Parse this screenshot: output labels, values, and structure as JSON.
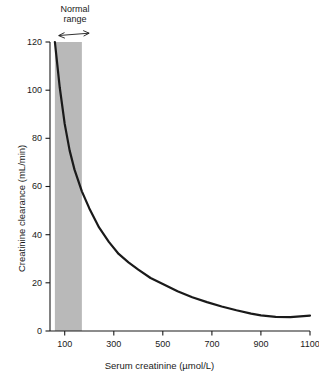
{
  "chart_data": {
    "type": "line",
    "title": "",
    "xlabel": "Serum creatinine (µmol/L)",
    "ylabel": "Creatinine clearance (mL/min)",
    "xlim": [
      40,
      1100
    ],
    "ylim": [
      0,
      120
    ],
    "grid": false,
    "legend": null,
    "xticks": [
      100,
      300,
      500,
      700,
      900,
      1100
    ],
    "xtick_labels": [
      "100",
      "300",
      "500",
      "700",
      "900",
      "1100"
    ],
    "yticks": [
      0,
      20,
      40,
      60,
      80,
      100,
      120
    ],
    "ytick_labels": [
      "0",
      "20",
      "40",
      "60",
      "80",
      "100",
      "120"
    ],
    "series": [
      {
        "name": "Creatinine clearance",
        "color": "#1a1a1a",
        "x": [
          60,
          80,
          100,
          120,
          140,
          170,
          200,
          240,
          280,
          320,
          360,
          400,
          450,
          500,
          560,
          620,
          680,
          740,
          800,
          860,
          900,
          960,
          1020,
          1100
        ],
        "y": [
          120,
          101,
          86,
          75,
          67,
          58,
          51,
          43,
          37,
          32,
          28.5,
          25.5,
          22,
          19.5,
          16.5,
          14,
          12,
          10.2,
          8.6,
          7.2,
          6.5,
          5.9,
          5.8,
          6.4
        ]
      }
    ],
    "shaded_regions": [
      {
        "name": "normal-range-band",
        "label": "Normal range",
        "x_start": 60,
        "x_end": 170,
        "y_start": 0,
        "y_end": 120,
        "color": "#b9b9b9"
      }
    ],
    "annotations": [
      {
        "name": "normal-range-annotation",
        "text_line1": "Normal",
        "text_line2": "range",
        "arrow": "double-headed-horizontal",
        "arrow_x_start": 60,
        "arrow_x_end": 170
      }
    ]
  },
  "axes": {
    "x_title": "Serum creatinine (µmol/L)",
    "y_title": "Creatinine clearance (mL/min)",
    "axis_color": "#1a1a1a"
  },
  "annotation": {
    "normal_line1": "Normal",
    "normal_line2": "range"
  },
  "ticks": {
    "x": [
      "100",
      "300",
      "500",
      "700",
      "900",
      "1100"
    ],
    "y": [
      "120",
      "100",
      "80",
      "60",
      "40",
      "20",
      "0"
    ]
  }
}
